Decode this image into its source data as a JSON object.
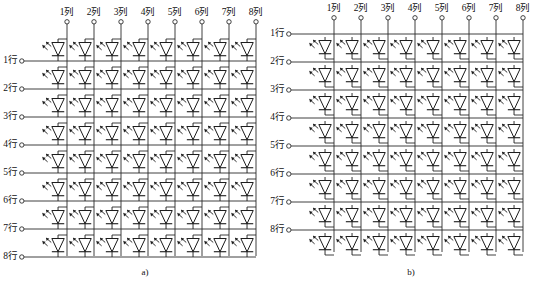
{
  "figure": {
    "panels": [
      {
        "id": "a",
        "caption": "a)",
        "caption_x": 145,
        "row_line_side": "bottom",
        "columns": [
          "1列",
          "2列",
          "3列",
          "4列",
          "5列",
          "6列",
          "7列",
          "8列"
        ],
        "rows": [
          "1行",
          "2行",
          "3行",
          "4行",
          "5行",
          "6行",
          "7行",
          "8行"
        ]
      },
      {
        "id": "b",
        "caption": "b)",
        "caption_x": 140,
        "row_line_side": "top",
        "columns": [
          "1列",
          "2列",
          "3列",
          "4列",
          "5列",
          "6列",
          "7列",
          "8列"
        ],
        "rows": [
          "1行",
          "2行",
          "3行",
          "4行",
          "5行",
          "6行",
          "7行",
          "8行"
        ]
      }
    ],
    "geometry": {
      "grid_cols": 8,
      "grid_rows": 8,
      "cell_w": 27,
      "cell_h": 28,
      "panel_a_origin_x": 44,
      "panel_a_origin_y": 36,
      "panel_b_origin_x": 40,
      "panel_b_origin_y": 32,
      "terminal_radius": 2.2
    },
    "colors": {
      "line": "#2b2b2b",
      "symbol": "#1a1a1a",
      "text": "#111111",
      "background": "#ffffff",
      "watermark": "#f2f2f2"
    },
    "symbol": {
      "name": "led-diode",
      "description": "downward triangle with cathode bar and two emission arrows"
    },
    "watermark_text": ""
  }
}
